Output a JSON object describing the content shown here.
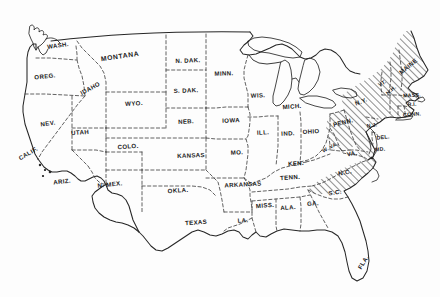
{
  "map": {
    "title": "United States map with state abbreviations",
    "description": "Outline map of the contiguous United States showing state boundaries, with a group of eastern states highlighted by diagonal hatch shading.",
    "colors": {
      "background": "#fdfdfd",
      "outline": "#262626",
      "interior_border": "#3a3a3a",
      "hatch": "#2b2b2b",
      "label_text": "#1a1a1a"
    },
    "style": {
      "national_border": "solid",
      "state_border": "dashed",
      "highlight_fill": "diagonal-hatch"
    },
    "legend": {
      "highlighted_note": "Hatched states",
      "highlighted_states": [
        "MAINE",
        "VT.",
        "N.H.",
        "MASS.",
        "R.I.",
        "CONN.",
        "N.Y.",
        "PENN.",
        "N.J.",
        "DEL.",
        "MD.",
        "N.C."
      ]
    },
    "labels": [
      {
        "name": "wash",
        "text": "WASH.",
        "x": 58,
        "y": 45,
        "rot": -8,
        "size": "n"
      },
      {
        "name": "oreg",
        "text": "OREG.",
        "x": 45,
        "y": 76,
        "rot": -6,
        "size": "n"
      },
      {
        "name": "idaho",
        "text": "IDAHO",
        "x": 90,
        "y": 88,
        "rot": -28,
        "size": "n"
      },
      {
        "name": "montana",
        "text": "MONTANA",
        "x": 120,
        "y": 56,
        "rot": -8,
        "size": "lg"
      },
      {
        "name": "ndak",
        "text": "N. DAK.",
        "x": 188,
        "y": 60,
        "rot": -2,
        "size": "n"
      },
      {
        "name": "sdak",
        "text": "S. DAK.",
        "x": 186,
        "y": 90,
        "rot": -2,
        "size": "n"
      },
      {
        "name": "minn",
        "text": "MINN.",
        "x": 224,
        "y": 73,
        "rot": -2,
        "size": "n"
      },
      {
        "name": "wis",
        "text": "WIS.",
        "x": 258,
        "y": 95,
        "rot": -2,
        "size": "n"
      },
      {
        "name": "mich",
        "text": "MICH.",
        "x": 292,
        "y": 106,
        "rot": -4,
        "size": "n"
      },
      {
        "name": "wyo",
        "text": "WYO.",
        "x": 134,
        "y": 103,
        "rot": -4,
        "size": "n"
      },
      {
        "name": "neb",
        "text": "NEB.",
        "x": 186,
        "y": 121,
        "rot": -3,
        "size": "n"
      },
      {
        "name": "iowa",
        "text": "IOWA",
        "x": 231,
        "y": 120,
        "rot": -2,
        "size": "n"
      },
      {
        "name": "ill",
        "text": "ILL.",
        "x": 263,
        "y": 132,
        "rot": -3,
        "size": "n"
      },
      {
        "name": "ind",
        "text": "IND.",
        "x": 288,
        "y": 133,
        "rot": -3,
        "size": "n"
      },
      {
        "name": "ohio",
        "text": "OHIO",
        "x": 311,
        "y": 131,
        "rot": -3,
        "size": "n"
      },
      {
        "name": "nev",
        "text": "NEV.",
        "x": 48,
        "y": 123,
        "rot": -7,
        "size": "n"
      },
      {
        "name": "utah",
        "text": "UTAH",
        "x": 80,
        "y": 132,
        "rot": -5,
        "size": "n"
      },
      {
        "name": "colo",
        "text": "COLO.",
        "x": 128,
        "y": 146,
        "rot": -4,
        "size": "n"
      },
      {
        "name": "kansas",
        "text": "KANSAS",
        "x": 191,
        "y": 155,
        "rot": -2,
        "size": "n"
      },
      {
        "name": "mo",
        "text": "MO.",
        "x": 237,
        "y": 152,
        "rot": -2,
        "size": "n"
      },
      {
        "name": "ken",
        "text": "KEN.",
        "x": 296,
        "y": 163,
        "rot": -4,
        "size": "n"
      },
      {
        "name": "wva",
        "text": "W. VA.",
        "x": 330,
        "y": 147,
        "rot": -28,
        "size": "sm"
      },
      {
        "name": "va",
        "text": "VA.",
        "x": 352,
        "y": 153,
        "rot": -10,
        "size": "n"
      },
      {
        "name": "calif",
        "text": "CALIF.",
        "x": 28,
        "y": 153,
        "rot": -30,
        "size": "n"
      },
      {
        "name": "ariz",
        "text": "ARIZ.",
        "x": 62,
        "y": 181,
        "rot": -6,
        "size": "n"
      },
      {
        "name": "nmex",
        "text": "N. MEX.",
        "x": 110,
        "y": 184,
        "rot": -6,
        "size": "n"
      },
      {
        "name": "okla",
        "text": "OKLA.",
        "x": 178,
        "y": 190,
        "rot": -4,
        "size": "n"
      },
      {
        "name": "arkansas",
        "text": "ARKANSAS",
        "x": 243,
        "y": 184,
        "rot": -3,
        "size": "n"
      },
      {
        "name": "tenn",
        "text": "TENN.",
        "x": 290,
        "y": 177,
        "rot": -4,
        "size": "n"
      },
      {
        "name": "nc",
        "text": "N.C.",
        "x": 345,
        "y": 172,
        "rot": -12,
        "size": "n"
      },
      {
        "name": "sc",
        "text": "S.C.",
        "x": 335,
        "y": 192,
        "rot": -8,
        "size": "n"
      },
      {
        "name": "ga",
        "text": "GA.",
        "x": 313,
        "y": 203,
        "rot": -5,
        "size": "n"
      },
      {
        "name": "ala",
        "text": "ALA.",
        "x": 288,
        "y": 207,
        "rot": -4,
        "size": "n"
      },
      {
        "name": "miss",
        "text": "MISS.",
        "x": 265,
        "y": 205,
        "rot": -4,
        "size": "n"
      },
      {
        "name": "la",
        "text": "LA.",
        "x": 243,
        "y": 220,
        "rot": -4,
        "size": "n"
      },
      {
        "name": "texas",
        "text": "TEXAS",
        "x": 196,
        "y": 222,
        "rot": -4,
        "size": "n"
      },
      {
        "name": "fla",
        "text": "FLA.",
        "x": 363,
        "y": 262,
        "rot": -58,
        "size": "n"
      },
      {
        "name": "penn",
        "text": "PENN.",
        "x": 343,
        "y": 122,
        "rot": -14,
        "size": "n"
      },
      {
        "name": "ny",
        "text": "N.Y.",
        "x": 361,
        "y": 101,
        "rot": -22,
        "size": "n"
      },
      {
        "name": "vt",
        "text": "VT.",
        "x": 382,
        "y": 83,
        "rot": -30,
        "size": "sm"
      },
      {
        "name": "nh",
        "text": "N.H.",
        "x": 391,
        "y": 90,
        "rot": -42,
        "size": "sm"
      },
      {
        "name": "maine",
        "text": "MAINE",
        "x": 408,
        "y": 66,
        "rot": -40,
        "size": "n"
      },
      {
        "name": "mass",
        "text": "MASS.",
        "x": 412,
        "y": 95,
        "rot": -4,
        "size": "sm"
      },
      {
        "name": "ri",
        "text": "R.I.",
        "x": 412,
        "y": 104,
        "rot": -4,
        "size": "sm"
      },
      {
        "name": "conn",
        "text": "CONN.",
        "x": 412,
        "y": 114,
        "rot": -4,
        "size": "sm"
      },
      {
        "name": "nj",
        "text": "N.J.",
        "x": 372,
        "y": 125,
        "rot": -8,
        "size": "sm"
      },
      {
        "name": "del",
        "text": "DEL.",
        "x": 383,
        "y": 137,
        "rot": -6,
        "size": "sm"
      },
      {
        "name": "md",
        "text": "MD.",
        "x": 380,
        "y": 149,
        "rot": -6,
        "size": "sm"
      }
    ]
  }
}
